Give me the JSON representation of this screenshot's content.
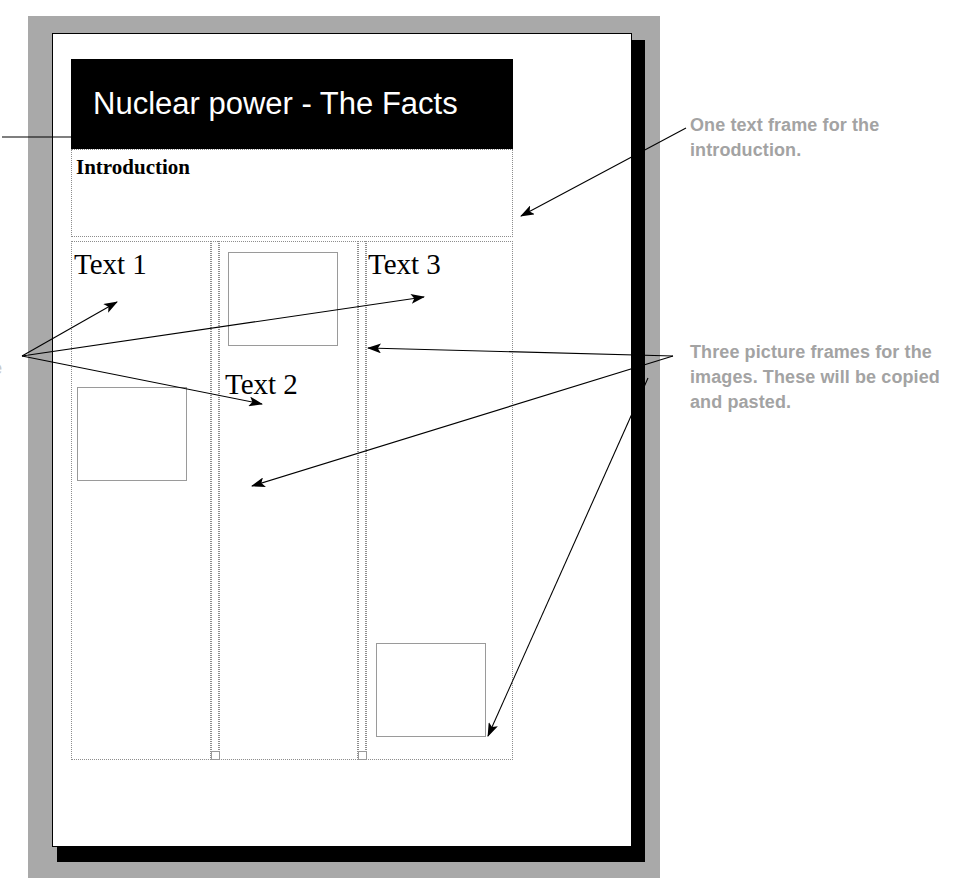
{
  "document_mockup": {
    "title_banner": {
      "text": "Nuclear power - The Facts"
    },
    "intro_frame": {
      "label": "Introduction"
    },
    "text_frames": [
      {
        "label": "Text 1"
      },
      {
        "label": "Text 2"
      },
      {
        "label": "Text 3"
      }
    ],
    "picture_frames": [
      {
        "name": "picture-frame-top"
      },
      {
        "name": "picture-frame-left"
      },
      {
        "name": "picture-frame-bottom"
      }
    ]
  },
  "annotations": [
    {
      "id": "intro-callout",
      "text": "One text frame for the introduction."
    },
    {
      "id": "pictures-callout",
      "text": "Three picture frames for the images. These will be copied and pasted."
    }
  ],
  "edge_fragment": {
    "text": "e"
  },
  "colors": {
    "banner_background": "#000000",
    "banner_text": "#ffffff",
    "page_background": "#ffffff",
    "frame_border": "#000000",
    "surround": "#a9a9a9",
    "annotation_text": "#a3a3a3",
    "guide_line": "#8d8d8d"
  }
}
